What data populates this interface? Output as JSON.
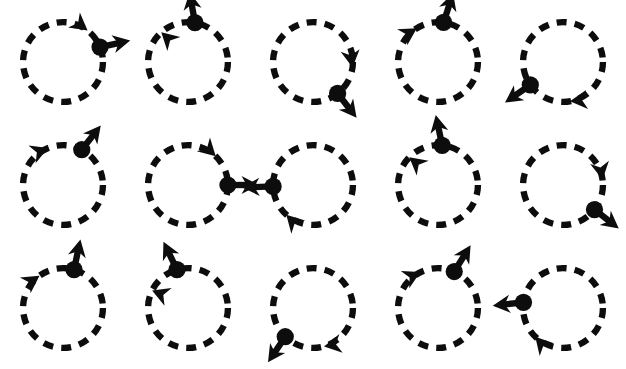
{
  "sheet": {
    "title": "Rotation Direction Icon Set",
    "background_color": "#ffffff",
    "ink_color": "#0d0d0d",
    "width": 626,
    "height": 369,
    "columns": 5,
    "rows": 3,
    "icon_count": 15,
    "style": {
      "circle_radius": 44,
      "circle_stroke_width": 7,
      "dash_pattern": "11 9",
      "dot_radius": 9.5,
      "radial_arrow_length": 34,
      "radial_arrow_shaft_width": 7,
      "radial_arrow_head_length": 19,
      "radial_arrow_head_width": 20,
      "tangent_arrow_head_length": 19,
      "tangent_arrow_head_width": 21
    }
  },
  "icons": [
    {
      "id": "icon-1",
      "name": "rotate-clockwise-dot-right",
      "row": 1,
      "col": 1,
      "rotation": "clockwise",
      "dot_angle_deg": 22,
      "radial_arrow_angle_deg": 12,
      "tangent_marker_angle_deg": 52,
      "tangent_arrow_heading_deg": -38,
      "label": "Clockwise rotation, marker at 2 o'clock"
    },
    {
      "id": "icon-2",
      "name": "rotate-counterclockwise-dot-top",
      "row": 1,
      "col": 2,
      "rotation": "counterclockwise",
      "dot_angle_deg": 80,
      "radial_arrow_angle_deg": 100,
      "tangent_marker_angle_deg": 132,
      "tangent_arrow_heading_deg": 137,
      "label": "Counter-clockwise rotation, marker at 12 o'clock"
    },
    {
      "id": "icon-3",
      "name": "rotate-clockwise-dot-lower-right",
      "row": 1,
      "col": 3,
      "rotation": "clockwise",
      "dot_angle_deg": -52,
      "radial_arrow_angle_deg": -52,
      "tangent_marker_angle_deg": -8,
      "tangent_arrow_heading_deg": -82,
      "label": "Clockwise rotation, marker at 4 o'clock"
    },
    {
      "id": "icon-4",
      "name": "rotate-clockwise-dot-top",
      "row": 1,
      "col": 4,
      "rotation": "clockwise",
      "dot_angle_deg": 82,
      "radial_arrow_angle_deg": 72,
      "tangent_marker_angle_deg": 122,
      "tangent_arrow_heading_deg": 32,
      "label": "Clockwise rotation, marker at 12 o'clock"
    },
    {
      "id": "icon-5",
      "name": "rotate-counterclockwise-dot-lower-left",
      "row": 1,
      "col": 5,
      "rotation": "counterclockwise",
      "dot_angle_deg": -145,
      "radial_arrow_angle_deg": -145,
      "tangent_marker_angle_deg": -80,
      "tangent_arrow_heading_deg": -174,
      "label": "Counter-clockwise rotation, marker at 8 o'clock"
    },
    {
      "id": "icon-6",
      "name": "rotate-clockwise-dot-upper-right",
      "row": 2,
      "col": 1,
      "rotation": "clockwise",
      "dot_angle_deg": 62,
      "radial_arrow_angle_deg": 52,
      "tangent_marker_angle_deg": 112,
      "tangent_arrow_heading_deg": 22,
      "label": "Clockwise rotation, marker at 1 o'clock"
    },
    {
      "id": "icon-7",
      "name": "rotate-clockwise-dot-right",
      "row": 2,
      "col": 2,
      "rotation": "clockwise",
      "dot_angle_deg": 0,
      "radial_arrow_angle_deg": 0,
      "tangent_marker_angle_deg": 46,
      "tangent_arrow_heading_deg": -44,
      "label": "Clockwise rotation, marker at 3 o'clock"
    },
    {
      "id": "icon-8",
      "name": "rotate-counterclockwise-dot-left",
      "row": 2,
      "col": 3,
      "rotation": "counterclockwise",
      "dot_angle_deg": 182,
      "radial_arrow_angle_deg": 182,
      "tangent_marker_angle_deg": -132,
      "tangent_arrow_heading_deg": 134,
      "label": "Counter-clockwise rotation, marker at 9 o'clock"
    },
    {
      "id": "icon-9",
      "name": "rotate-counterclockwise-dot-top",
      "row": 2,
      "col": 4,
      "rotation": "counterclockwise",
      "dot_angle_deg": 84,
      "radial_arrow_angle_deg": 102,
      "tangent_marker_angle_deg": 136,
      "tangent_arrow_heading_deg": 141,
      "label": "Counter-clockwise rotation, marker at 12 o'clock"
    },
    {
      "id": "icon-10",
      "name": "rotate-clockwise-dot-lower-right",
      "row": 2,
      "col": 5,
      "rotation": "clockwise",
      "dot_angle_deg": -38,
      "radial_arrow_angle_deg": -38,
      "tangent_marker_angle_deg": 8,
      "tangent_arrow_heading_deg": -80,
      "label": "Clockwise rotation, marker at 4 o'clock"
    },
    {
      "id": "icon-11",
      "name": "rotate-clockwise-dot-top",
      "row": 3,
      "col": 1,
      "rotation": "clockwise",
      "dot_angle_deg": 74,
      "radial_arrow_angle_deg": 78,
      "tangent_marker_angle_deg": 126,
      "tangent_arrow_heading_deg": 34,
      "label": "Clockwise rotation, marker at 12 o'clock"
    },
    {
      "id": "icon-12",
      "name": "rotate-counterclockwise-dot-upper-left",
      "row": 3,
      "col": 2,
      "rotation": "counterclockwise",
      "dot_angle_deg": 106,
      "radial_arrow_angle_deg": 116,
      "tangent_marker_angle_deg": 154,
      "tangent_arrow_heading_deg": 158,
      "label": "Counter-clockwise rotation, marker at 11 o'clock"
    },
    {
      "id": "icon-13",
      "name": "rotate-counterclockwise-dot-lower-left",
      "row": 3,
      "col": 3,
      "rotation": "counterclockwise",
      "dot_angle_deg": -134,
      "radial_arrow_angle_deg": -124,
      "tangent_marker_angle_deg": -74,
      "tangent_arrow_heading_deg": -170,
      "label": "Counter-clockwise rotation, marker at 7 o'clock"
    },
    {
      "id": "icon-14",
      "name": "rotate-clockwise-dot-upper-right",
      "row": 3,
      "col": 4,
      "rotation": "clockwise",
      "dot_angle_deg": 66,
      "radial_arrow_angle_deg": 58,
      "tangent_marker_angle_deg": 116,
      "tangent_arrow_heading_deg": 26,
      "label": "Clockwise rotation, marker at 1 o'clock"
    },
    {
      "id": "icon-15",
      "name": "rotate-counterclockwise-dot-left",
      "row": 3,
      "col": 5,
      "rotation": "counterclockwise",
      "dot_angle_deg": 172,
      "radial_arrow_angle_deg": 186,
      "tangent_marker_angle_deg": -134,
      "tangent_arrow_heading_deg": 132,
      "label": "Counter-clockwise rotation, marker at 9 o'clock"
    }
  ]
}
